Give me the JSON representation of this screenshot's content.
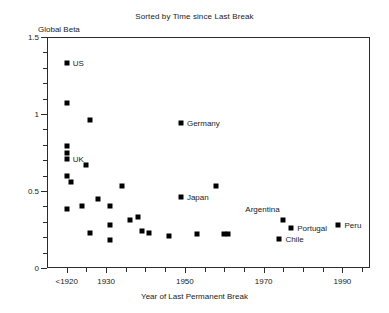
{
  "chart_data": {
    "type": "scatter",
    "title": "Sorted by Time since Last Break",
    "xlabel": "Year of Last Permanent Break",
    "ylabel": "Global Beta",
    "xlim": [
      1915,
      1997
    ],
    "ylim": [
      0,
      1.5
    ],
    "grid": false,
    "legend": "none",
    "marker": "filled-square",
    "marker_color": "#000000",
    "xticks": [
      {
        "value": 1920,
        "label": "<1920",
        "major": true
      },
      {
        "value": 1925,
        "label": "",
        "major": false
      },
      {
        "value": 1930,
        "label": "1930",
        "major": true
      },
      {
        "value": 1935,
        "label": "",
        "major": false
      },
      {
        "value": 1940,
        "label": "",
        "major": false
      },
      {
        "value": 1945,
        "label": "",
        "major": false
      },
      {
        "value": 1950,
        "label": "1950",
        "major": true
      },
      {
        "value": 1955,
        "label": "",
        "major": false
      },
      {
        "value": 1960,
        "label": "",
        "major": false
      },
      {
        "value": 1965,
        "label": "",
        "major": false
      },
      {
        "value": 1970,
        "label": "1970",
        "major": true
      },
      {
        "value": 1975,
        "label": "",
        "major": false
      },
      {
        "value": 1980,
        "label": "",
        "major": false
      },
      {
        "value": 1985,
        "label": "",
        "major": false
      },
      {
        "value": 1990,
        "label": "1990",
        "major": true
      },
      {
        "value": 1995,
        "label": "",
        "major": false
      }
    ],
    "yticks": [
      {
        "value": 0,
        "label": "0",
        "major": true
      },
      {
        "value": 0.1,
        "label": "",
        "major": false
      },
      {
        "value": 0.2,
        "label": "",
        "major": false
      },
      {
        "value": 0.3,
        "label": "",
        "major": false
      },
      {
        "value": 0.4,
        "label": "",
        "major": false
      },
      {
        "value": 0.5,
        "label": "0.5",
        "major": true
      },
      {
        "value": 0.6,
        "label": "",
        "major": false
      },
      {
        "value": 0.7,
        "label": "",
        "major": false
      },
      {
        "value": 0.8,
        "label": "",
        "major": false
      },
      {
        "value": 0.9,
        "label": "",
        "major": false
      },
      {
        "value": 1.0,
        "label": "1",
        "major": true
      },
      {
        "value": 1.1,
        "label": "",
        "major": false
      },
      {
        "value": 1.2,
        "label": "",
        "major": false
      },
      {
        "value": 1.3,
        "label": "",
        "major": false
      },
      {
        "value": 1.4,
        "label": "",
        "major": false
      },
      {
        "value": 1.5,
        "label": "1.5",
        "major": true
      }
    ],
    "points": [
      {
        "x": 1920,
        "y": 1.33,
        "label": "US",
        "label_pos": "right"
      },
      {
        "x": 1920,
        "y": 1.07,
        "label": "",
        "label_pos": "right"
      },
      {
        "x": 1926,
        "y": 0.96,
        "label": "",
        "label_pos": "right"
      },
      {
        "x": 1949,
        "y": 0.94,
        "label": "Germany",
        "label_pos": "right"
      },
      {
        "x": 1920,
        "y": 0.79,
        "label": "",
        "label_pos": "right"
      },
      {
        "x": 1920,
        "y": 0.75,
        "label": "",
        "label_pos": "right"
      },
      {
        "x": 1920,
        "y": 0.71,
        "label": "UK",
        "label_pos": "right"
      },
      {
        "x": 1925,
        "y": 0.67,
        "label": "",
        "label_pos": "right"
      },
      {
        "x": 1920,
        "y": 0.6,
        "label": "",
        "label_pos": "right"
      },
      {
        "x": 1921,
        "y": 0.56,
        "label": "",
        "label_pos": "right"
      },
      {
        "x": 1934,
        "y": 0.53,
        "label": "",
        "label_pos": "right"
      },
      {
        "x": 1958,
        "y": 0.53,
        "label": "",
        "label_pos": "right"
      },
      {
        "x": 1949,
        "y": 0.46,
        "label": "Japan",
        "label_pos": "right"
      },
      {
        "x": 1928,
        "y": 0.45,
        "label": "",
        "label_pos": "right"
      },
      {
        "x": 1924,
        "y": 0.4,
        "label": "",
        "label_pos": "right"
      },
      {
        "x": 1931,
        "y": 0.4,
        "label": "",
        "label_pos": "right"
      },
      {
        "x": 1920,
        "y": 0.38,
        "label": "",
        "label_pos": "right"
      },
      {
        "x": 1938,
        "y": 0.33,
        "label": "",
        "label_pos": "right"
      },
      {
        "x": 1936,
        "y": 0.31,
        "label": "",
        "label_pos": "right"
      },
      {
        "x": 1975,
        "y": 0.31,
        "label": "Argentina",
        "label_pos": "above"
      },
      {
        "x": 1989,
        "y": 0.28,
        "label": "Peru",
        "label_pos": "right"
      },
      {
        "x": 1931,
        "y": 0.28,
        "label": "",
        "label_pos": "right"
      },
      {
        "x": 1977,
        "y": 0.26,
        "label": "Portugal",
        "label_pos": "right"
      },
      {
        "x": 1939,
        "y": 0.24,
        "label": "",
        "label_pos": "right"
      },
      {
        "x": 1941,
        "y": 0.23,
        "label": "",
        "label_pos": "right"
      },
      {
        "x": 1926,
        "y": 0.23,
        "label": "",
        "label_pos": "right"
      },
      {
        "x": 1960,
        "y": 0.22,
        "label": "",
        "label_pos": "right"
      },
      {
        "x": 1961,
        "y": 0.22,
        "label": "",
        "label_pos": "right"
      },
      {
        "x": 1953,
        "y": 0.22,
        "label": "",
        "label_pos": "right"
      },
      {
        "x": 1946,
        "y": 0.21,
        "label": "",
        "label_pos": "right"
      },
      {
        "x": 1974,
        "y": 0.19,
        "label": "Chile",
        "label_pos": "right"
      },
      {
        "x": 1931,
        "y": 0.18,
        "label": "",
        "label_pos": "right"
      }
    ]
  }
}
